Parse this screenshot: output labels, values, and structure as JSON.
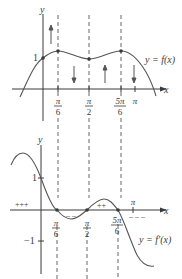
{
  "diagram": {
    "top_graph": {
      "y_axis_label": "y",
      "x_axis_label": "x",
      "y_tick_1": "1",
      "curve_label": "y = f(x)",
      "x_ticks": [
        {
          "num": "π",
          "den": "6"
        },
        {
          "num": "π",
          "den": "2"
        },
        {
          "num": "5π",
          "den": "6"
        }
      ],
      "pi_label": "π",
      "arrows": [
        "up",
        "down",
        "up",
        "down"
      ]
    },
    "bottom_graph": {
      "y_axis_label": "y",
      "x_axis_label": "x",
      "y_tick_1": "1",
      "y_tick_neg1": "−1",
      "curve_label": "y = f′(x)",
      "x_ticks": [
        {
          "num": "π",
          "den": "6"
        },
        {
          "num": "π",
          "den": "2"
        },
        {
          "num": "5π",
          "den": "6"
        }
      ],
      "pi_label": "π",
      "sign_labels": {
        "left_positive": "+++",
        "middle_negative": "– –",
        "right_positive": "++",
        "far_right_negative": "– – –"
      }
    },
    "colors": {
      "ink": "#3a3a3a",
      "curve": "#555555",
      "background": "#ffffff"
    }
  }
}
